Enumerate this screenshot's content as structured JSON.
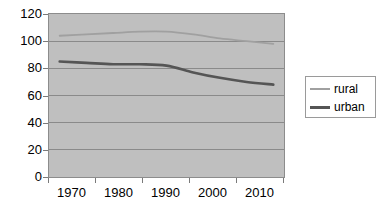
{
  "chart_data": {
    "type": "line",
    "title": "",
    "xlabel": "",
    "ylabel": "",
    "xlim": [
      1968,
      2012
    ],
    "ylim": [
      0,
      120
    ],
    "grid": true,
    "legend_position": "right",
    "x_ticks": [
      "1970",
      "1980",
      "1990",
      "2000",
      "2010"
    ],
    "y_ticks": [
      "0",
      "20",
      "40",
      "60",
      "80",
      "100",
      "120"
    ],
    "x": [
      1970,
      1975,
      1980,
      1985,
      1990,
      1995,
      2000,
      2005,
      2010
    ],
    "series": [
      {
        "name": "rural",
        "color": "#a0a0a0",
        "values": [
          104,
          105,
          106,
          107,
          107,
          105,
          102,
          100,
          98
        ]
      },
      {
        "name": "urban",
        "color": "#555555",
        "values": [
          85,
          84,
          83,
          83,
          82,
          77,
          73,
          70,
          68
        ]
      }
    ]
  },
  "legend": {
    "entries": [
      {
        "label": "rural"
      },
      {
        "label": "urban"
      }
    ]
  },
  "colors": {
    "plot_background": "#bfbfbf",
    "plot_border": "#8c8c8c",
    "gridline": "#8a8a8a",
    "page_background": "#ffffff",
    "rural_line": "#a0a0a0",
    "urban_line": "#555555",
    "axis_text": "#000000"
  }
}
